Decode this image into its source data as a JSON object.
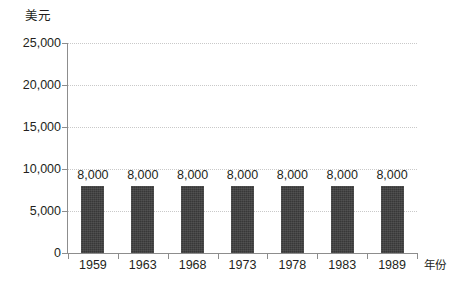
{
  "chart_data": {
    "type": "bar",
    "title": "",
    "subtitle": "",
    "xlabel": "年份",
    "ylabel": "美元",
    "categories": [
      "1959",
      "1963",
      "1968",
      "1973",
      "1978",
      "1983",
      "1989"
    ],
    "values": [
      8000,
      8000,
      8000,
      8000,
      8000,
      8000,
      8000
    ],
    "data_labels": [
      "8,000",
      "8,000",
      "8,000",
      "8,000",
      "8,000",
      "8,000",
      "8,000"
    ],
    "ylim": [
      0,
      25000
    ],
    "y_ticks": [
      0,
      5000,
      10000,
      15000,
      20000,
      25000
    ],
    "y_tick_labels": [
      "0",
      "5,000",
      "10,000",
      "15,000",
      "20,000",
      "25,000"
    ],
    "grid": "horizontal-dotted",
    "legend": "none",
    "series": [
      {
        "name": "",
        "values": [
          8000,
          8000,
          8000,
          8000,
          8000,
          8000,
          8000
        ],
        "color": "#383838"
      }
    ],
    "colors": {
      "bar": "#383838",
      "gridline": "#c9c9c9",
      "axis": "#8d8d8d",
      "text": "#231f20",
      "background": "#ffffff"
    }
  }
}
